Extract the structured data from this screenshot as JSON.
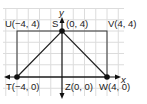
{
  "diagram": {
    "type": "coordinate-plane",
    "axes": {
      "x_label": "x",
      "y_label": "y"
    },
    "points": [
      {
        "id": "U",
        "label": "U(−4, 4)",
        "x": -4,
        "y": 4,
        "dot": false
      },
      {
        "id": "S",
        "label_name": "S",
        "label_coords": "(0, 4)",
        "x": 0,
        "y": 4,
        "dot": true
      },
      {
        "id": "V",
        "label": "V(4, 4)",
        "x": 4,
        "y": 4,
        "dot": false
      },
      {
        "id": "T",
        "label": "T(−4, 0)",
        "x": -4,
        "y": 0,
        "dot": true
      },
      {
        "id": "Z",
        "label": "Z(0, 0)",
        "x": 0,
        "y": 0,
        "dot": false
      },
      {
        "id": "W",
        "label": "W(4, 0)",
        "x": 4,
        "y": 0,
        "dot": true
      }
    ],
    "shapes": [
      {
        "type": "rectangle",
        "vertices": [
          "T",
          "U",
          "V",
          "W"
        ]
      },
      {
        "type": "triangle",
        "vertices": [
          "T",
          "S",
          "W"
        ]
      }
    ],
    "colors": {
      "grid": "#d9d9d9",
      "lines": "#222222",
      "background": "#ffffff"
    }
  }
}
